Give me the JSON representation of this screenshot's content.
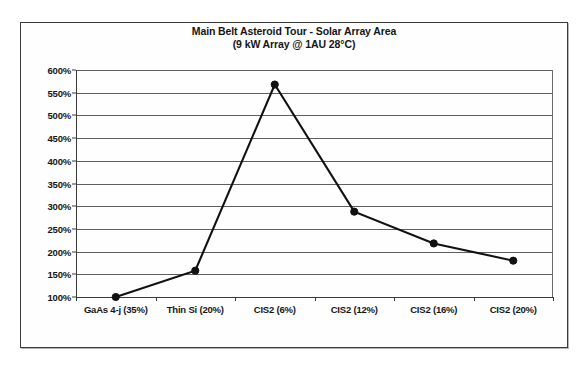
{
  "chart_data": {
    "type": "line",
    "title": "Main Belt Asteroid Tour - Solar Array Area",
    "subtitle": "(9 kW Array @ 1AU 28°C)",
    "xlabel": "",
    "ylabel": "",
    "categories": [
      "GaAs 4-j (35%)",
      "Thin Si (20%)",
      "CIS2 (6%)",
      "CIS2 (12%)",
      "CIS2 (16%)",
      "CIS2 (20%)"
    ],
    "values": [
      100,
      158,
      568,
      288,
      218,
      180
    ],
    "value_suffix": "%",
    "ylim": [
      100,
      600
    ],
    "ytick_values": [
      100,
      150,
      200,
      250,
      300,
      350,
      400,
      450,
      500,
      550,
      600
    ],
    "ytick_labels": [
      "100%",
      "150%",
      "200%",
      "250%",
      "300%",
      "350%",
      "400%",
      "450%",
      "500%",
      "550%",
      "600%"
    ],
    "grid": true,
    "legend": false,
    "series_color": "#111111",
    "gridline_color": "#5e5e5e",
    "axis_color": "#3a3a3a",
    "marker": "circle"
  }
}
